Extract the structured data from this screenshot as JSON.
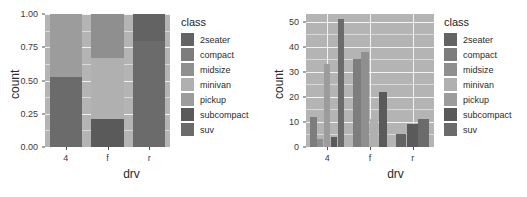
{
  "figures": [
    {
      "id": "stacked-proportion-chart",
      "legend_title": "class",
      "xlabel": "drv",
      "ylabel": "count",
      "yticks": [
        "1.00",
        "0.75",
        "0.50",
        "0.25",
        "0.00"
      ],
      "xticks": [
        "4",
        "f",
        "r"
      ]
    },
    {
      "id": "dodged-count-chart",
      "legend_title": "class",
      "xlabel": "drv",
      "ylabel": "count",
      "yticks": [
        "50",
        "40",
        "30",
        "20",
        "10",
        "0"
      ],
      "xticks": [
        "4",
        "f",
        "r"
      ]
    }
  ],
  "classes": [
    {
      "name": "2seater",
      "color": "#636363"
    },
    {
      "name": "compact",
      "color": "#7d7d7d"
    },
    {
      "name": "midsize",
      "color": "#8f8f8f"
    },
    {
      "name": "minivan",
      "color": "#b0b0b0"
    },
    {
      "name": "pickup",
      "color": "#9c9c9c"
    },
    {
      "name": "subcompact",
      "color": "#5a5a5a"
    },
    {
      "name": "suv",
      "color": "#6b6b6b"
    }
  ],
  "chart_data": [
    {
      "type": "bar",
      "subtype": "stacked-fill",
      "title": "",
      "xlabel": "drv",
      "ylabel": "count",
      "categories": [
        "4",
        "f",
        "r"
      ],
      "ylim": [
        0,
        1
      ],
      "yticks": [
        0.0,
        0.25,
        0.5,
        0.75,
        1.0
      ],
      "ytick_labels": [
        "0.00",
        "0.25",
        "0.50",
        "0.75",
        "1.00"
      ],
      "grid": true,
      "legend_position": "right",
      "legend_title": "class",
      "series": [
        {
          "name": "2seater",
          "values": [
            0.0,
            0.0,
            0.2
          ]
        },
        {
          "name": "compact",
          "values": [
            0.0,
            0.0,
            0.0
          ]
        },
        {
          "name": "midsize",
          "values": [
            0.0,
            0.33,
            0.0
          ]
        },
        {
          "name": "minivan",
          "values": [
            0.0,
            0.46,
            0.0
          ]
        },
        {
          "name": "pickup",
          "values": [
            0.47,
            0.0,
            0.0
          ]
        },
        {
          "name": "subcompact",
          "values": [
            0.0,
            0.21,
            0.0
          ]
        },
        {
          "name": "suv",
          "values": [
            0.53,
            0.0,
            0.8
          ]
        }
      ],
      "stack_segments": [
        {
          "category": "4",
          "segments": [
            {
              "class": "suv",
              "from": 0.0,
              "to": 0.53
            },
            {
              "class": "pickup",
              "from": 0.53,
              "to": 1.0
            }
          ]
        },
        {
          "category": "f",
          "segments": [
            {
              "class": "subcompact",
              "from": 0.0,
              "to": 0.21
            },
            {
              "class": "minivan",
              "from": 0.21,
              "to": 0.67
            },
            {
              "class": "midsize",
              "from": 0.67,
              "to": 1.0
            }
          ]
        },
        {
          "category": "r",
          "segments": [
            {
              "class": "suv",
              "from": 0.0,
              "to": 0.8
            },
            {
              "class": "2seater",
              "from": 0.8,
              "to": 1.0
            }
          ]
        }
      ]
    },
    {
      "type": "bar",
      "subtype": "dodged",
      "title": "",
      "xlabel": "drv",
      "ylabel": "count",
      "categories": [
        "4",
        "f",
        "r"
      ],
      "ylim": [
        0,
        53
      ],
      "yticks": [
        0,
        10,
        20,
        30,
        40,
        50
      ],
      "ytick_labels": [
        "0",
        "10",
        "20",
        "30",
        "40",
        "50"
      ],
      "grid": true,
      "legend_position": "right",
      "legend_title": "class",
      "series": [
        {
          "name": "2seater",
          "values": [
            0,
            0,
            5
          ]
        },
        {
          "name": "compact",
          "values": [
            12,
            35,
            0
          ]
        },
        {
          "name": "midsize",
          "values": [
            3,
            38,
            0
          ]
        },
        {
          "name": "minivan",
          "values": [
            0,
            11,
            0
          ]
        },
        {
          "name": "pickup",
          "values": [
            33,
            0,
            0
          ]
        },
        {
          "name": "subcompact",
          "values": [
            4,
            22,
            9
          ]
        },
        {
          "name": "suv",
          "values": [
            51,
            0,
            11
          ]
        }
      ],
      "bars": [
        {
          "category": "4",
          "class": "compact",
          "value": 12
        },
        {
          "category": "4",
          "class": "midsize",
          "value": 3
        },
        {
          "category": "4",
          "class": "pickup",
          "value": 33
        },
        {
          "category": "4",
          "class": "subcompact",
          "value": 4
        },
        {
          "category": "4",
          "class": "suv",
          "value": 51
        },
        {
          "category": "f",
          "class": "compact",
          "value": 35
        },
        {
          "category": "f",
          "class": "midsize",
          "value": 38
        },
        {
          "category": "f",
          "class": "minivan",
          "value": 11
        },
        {
          "category": "f",
          "class": "subcompact",
          "value": 22
        },
        {
          "category": "r",
          "class": "2seater",
          "value": 5
        },
        {
          "category": "r",
          "class": "subcompact",
          "value": 9
        },
        {
          "category": "r",
          "class": "suv",
          "value": 11
        }
      ]
    }
  ]
}
